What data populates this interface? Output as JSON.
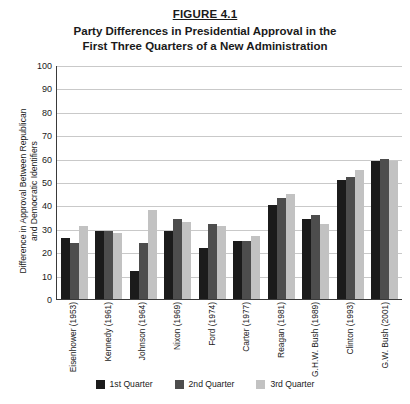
{
  "figure": {
    "number": "FIGURE 4.1",
    "title_line_1": "Party Differences in Presidential Approval in the",
    "title_line_2": "First Three Quarters of a New Administration"
  },
  "chart_data": {
    "type": "bar",
    "title": "Party Differences in Presidential Approval in the First Three Quarters of a New Administration",
    "xlabel": "",
    "ylabel_line_1": "Difference in Approval Between Republican",
    "ylabel_line_2": "and Democratic Identifiers",
    "ylim": [
      0,
      100
    ],
    "ytick_step": 10,
    "yticks": [
      100,
      90,
      80,
      70,
      60,
      50,
      40,
      30,
      20,
      10,
      0
    ],
    "grid": true,
    "legend_position": "bottom",
    "categories": [
      "Eisenhower (1953)",
      "Kennedy (1961)",
      "Johnson (1964)",
      "Nixon (1969)",
      "Ford (1974)",
      "Carter (1977)",
      "Reagan (1981)",
      "G.H.W. Bush (1989)",
      "Clinton (1993)",
      "G.W. Bush (2001)"
    ],
    "series": [
      {
        "name": "1st Quarter",
        "color": "#1b1b1b",
        "values": [
          26,
          29,
          12,
          29,
          22,
          25,
          40,
          34,
          51,
          59
        ]
      },
      {
        "name": "2nd Quarter",
        "color": "#4d4d4d",
        "values": [
          24,
          29,
          24,
          34,
          32,
          25,
          43,
          36,
          52,
          60
        ]
      },
      {
        "name": "3rd Quarter",
        "color": "#c2c2c2",
        "values": [
          31,
          28,
          38,
          33,
          31,
          27,
          45,
          32,
          55,
          59
        ]
      }
    ]
  },
  "legend": [
    {
      "label": "1st Quarter",
      "key": "q1"
    },
    {
      "label": "2nd Quarter",
      "key": "q2"
    },
    {
      "label": "3rd Quarter",
      "key": "q3"
    }
  ]
}
